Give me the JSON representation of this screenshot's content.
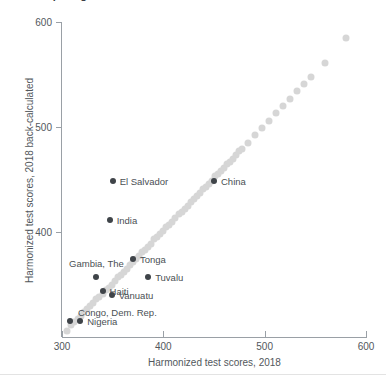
{
  "title_clipped": "Comparing harmonized test scores",
  "chart_data": {
    "type": "scatter",
    "title": "Comparing harmonized test scores",
    "xlabel": "Harmonized test scores, 2018",
    "ylabel": "Harmonized test scores, 2018 back-calculated",
    "xlim": [
      300,
      600
    ],
    "ylim": [
      300,
      600
    ],
    "xticks": [
      300,
      400,
      500,
      600
    ],
    "yticks": [
      400,
      500,
      600
    ],
    "grid": false,
    "legend": false,
    "series": [
      {
        "name": "All countries",
        "color": "#d6d6d6",
        "marker": "circle",
        "labelled": false,
        "points": [
          [
            305,
            306
          ],
          [
            309,
            311
          ],
          [
            312,
            314
          ],
          [
            316,
            317
          ],
          [
            319,
            320
          ],
          [
            322,
            324
          ],
          [
            325,
            327
          ],
          [
            328,
            330
          ],
          [
            331,
            332
          ],
          [
            334,
            336
          ],
          [
            337,
            338
          ],
          [
            340,
            341
          ],
          [
            343,
            345
          ],
          [
            346,
            347
          ],
          [
            349,
            350
          ],
          [
            352,
            353
          ],
          [
            355,
            357
          ],
          [
            358,
            359
          ],
          [
            361,
            362
          ],
          [
            364,
            365
          ],
          [
            367,
            369
          ],
          [
            370,
            371
          ],
          [
            373,
            374
          ],
          [
            376,
            377
          ],
          [
            379,
            381
          ],
          [
            382,
            383
          ],
          [
            385,
            386
          ],
          [
            388,
            389
          ],
          [
            391,
            393
          ],
          [
            394,
            395
          ],
          [
            397,
            398
          ],
          [
            400,
            401
          ],
          [
            403,
            405
          ],
          [
            406,
            407
          ],
          [
            409,
            410
          ],
          [
            412,
            413
          ],
          [
            415,
            417
          ],
          [
            418,
            419
          ],
          [
            421,
            422
          ],
          [
            424,
            425
          ],
          [
            427,
            429
          ],
          [
            430,
            431
          ],
          [
            433,
            434
          ],
          [
            436,
            437
          ],
          [
            439,
            441
          ],
          [
            442,
            443
          ],
          [
            445,
            446
          ],
          [
            448,
            449
          ],
          [
            451,
            453
          ],
          [
            454,
            455
          ],
          [
            457,
            458
          ],
          [
            460,
            461
          ],
          [
            463,
            465
          ],
          [
            466,
            467
          ],
          [
            469,
            470
          ],
          [
            472,
            473
          ],
          [
            475,
            477
          ],
          [
            478,
            479
          ],
          [
            484,
            485
          ],
          [
            490,
            492
          ],
          [
            497,
            499
          ],
          [
            504,
            506
          ],
          [
            511,
            513
          ],
          [
            518,
            520
          ],
          [
            525,
            527
          ],
          [
            532,
            534
          ],
          [
            539,
            541
          ],
          [
            546,
            548
          ],
          [
            560,
            561
          ],
          [
            580,
            585
          ]
        ]
      },
      {
        "name": "Highlighted countries",
        "color": "#3f4449",
        "marker": "circle",
        "labelled": true,
        "points": [
          {
            "label": "El Salvador",
            "x": 350,
            "y": 449,
            "label_pos": "right"
          },
          {
            "label": "China",
            "x": 450,
            "y": 449,
            "label_pos": "right"
          },
          {
            "label": "India",
            "x": 347,
            "y": 411,
            "label_pos": "right"
          },
          {
            "label": "Tonga",
            "x": 370,
            "y": 374,
            "label_pos": "right"
          },
          {
            "label": "Tuvalu",
            "x": 385,
            "y": 357,
            "label_pos": "right"
          },
          {
            "label": "Gambia, The",
            "x": 334,
            "y": 357,
            "label_pos": "above"
          },
          {
            "label": "Haiti",
            "x": 340,
            "y": 344,
            "label_pos": "right"
          },
          {
            "label": "Vanuatu",
            "x": 349,
            "y": 340,
            "label_pos": "right"
          },
          {
            "label": "Congo, Dem. Rep.",
            "x": 308,
            "y": 315,
            "label_pos": "above-right"
          },
          {
            "label": "Nigeria",
            "x": 318,
            "y": 315,
            "label_pos": "right"
          }
        ]
      }
    ]
  }
}
